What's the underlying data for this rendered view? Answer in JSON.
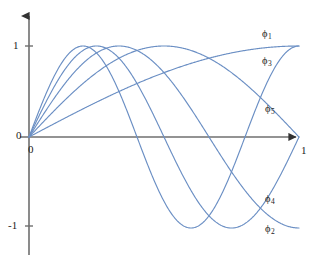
{
  "figure": {
    "width": 322,
    "height": 263,
    "background": "#ffffff",
    "curve_color": "#6b8fc4",
    "axis_color": "#555555",
    "text_color": "#1b1b1b"
  },
  "axes": {
    "x_axis_label": "1",
    "x_origin_label": "0",
    "y_origin_label": "0",
    "y_tick_top_label": "1",
    "y_tick_bottom_label": "-1",
    "x_arrow": "arrow-right",
    "y_arrow": "arrow-up"
  },
  "labels": {
    "phi1": "ϕ",
    "phi1_sub": "1",
    "phi2": "ϕ",
    "phi2_sub": "2",
    "phi3": "ϕ",
    "phi3_sub": "3",
    "phi4": "ϕ",
    "phi4_sub": "4",
    "phi5": "ϕ",
    "phi5_sub": "5"
  },
  "chart_data": {
    "type": "line",
    "title": "",
    "xlabel": "",
    "ylabel": "",
    "xlim": [
      0,
      1
    ],
    "ylim": [
      -1,
      1
    ],
    "xticks": [
      0,
      1
    ],
    "xticklabels": [
      "0",
      "1"
    ],
    "yticks": [
      -1,
      0,
      1
    ],
    "yticklabels": [
      "-1",
      "0",
      "1"
    ],
    "grid": false,
    "legend": "inline-curve-labels",
    "series": [
      {
        "name": "ϕ₁",
        "n": 1,
        "formula": "sin(pi*x/2)",
        "label_position": {
          "x": 0.82,
          "y": 0.93
        },
        "x": [
          0,
          0.05,
          0.1,
          0.15,
          0.2,
          0.25,
          0.3,
          0.35,
          0.4,
          0.45,
          0.5,
          0.55,
          0.6,
          0.65,
          0.7,
          0.75,
          0.8,
          0.85,
          0.9,
          0.95,
          1
        ],
        "values": [
          0,
          0.078,
          0.156,
          0.233,
          0.309,
          0.383,
          0.454,
          0.522,
          0.588,
          0.649,
          0.707,
          0.76,
          0.809,
          0.853,
          0.891,
          0.924,
          0.951,
          0.972,
          0.988,
          0.997,
          1
        ]
      },
      {
        "name": "ϕ₂",
        "n": 2,
        "formula": "sin(2*pi*x/2)",
        "label_position": {
          "x": 0.82,
          "y": -0.96
        },
        "x": [
          0,
          0.05,
          0.1,
          0.15,
          0.2,
          0.25,
          0.3,
          0.35,
          0.4,
          0.45,
          0.5,
          0.55,
          0.6,
          0.65,
          0.7,
          0.75,
          0.8,
          0.85,
          0.9,
          0.95,
          1
        ],
        "values": [
          0,
          0.156,
          0.309,
          0.454,
          0.588,
          0.707,
          0.809,
          0.891,
          0.951,
          0.988,
          1,
          0.988,
          0.951,
          0.891,
          0.809,
          0.707,
          0.588,
          0.454,
          0.309,
          0.156,
          0
        ]
      },
      {
        "name": "ϕ₃",
        "n": 3,
        "formula": "sin(3*pi*x/2)",
        "label_position": {
          "x": 0.82,
          "y": 0.7
        },
        "x": [
          0,
          0.05,
          0.1,
          0.15,
          0.2,
          0.25,
          0.3,
          0.35,
          0.4,
          0.45,
          0.5,
          0.55,
          0.6,
          0.65,
          0.7,
          0.75,
          0.8,
          0.85,
          0.9,
          0.95,
          1
        ],
        "values": [
          0,
          0.233,
          0.454,
          0.649,
          0.809,
          0.924,
          0.988,
          0.997,
          0.951,
          0.853,
          0.707,
          0.522,
          0.309,
          0.078,
          -0.156,
          -0.383,
          -0.588,
          -0.76,
          -0.891,
          -0.972,
          -1
        ]
      },
      {
        "name": "ϕ₄",
        "n": 4,
        "formula": "sin(4*pi*x/2)",
        "label_position": {
          "x": 0.82,
          "y": -0.62
        },
        "x": [
          0,
          0.05,
          0.1,
          0.15,
          0.2,
          0.25,
          0.3,
          0.35,
          0.4,
          0.45,
          0.5,
          0.55,
          0.6,
          0.65,
          0.7,
          0.75,
          0.8,
          0.85,
          0.9,
          0.95,
          1
        ],
        "values": [
          0,
          0.309,
          0.588,
          0.809,
          0.951,
          1,
          0.951,
          0.809,
          0.588,
          0.309,
          0,
          -0.309,
          -0.588,
          -0.809,
          -0.951,
          -1,
          -0.951,
          -0.809,
          -0.588,
          -0.309,
          0
        ]
      },
      {
        "name": "ϕ₅",
        "n": 5,
        "formula": "sin(5*pi*x/2)",
        "label_position": {
          "x": 0.83,
          "y": 0.18
        },
        "x": [
          0,
          0.05,
          0.1,
          0.15,
          0.2,
          0.25,
          0.3,
          0.35,
          0.4,
          0.45,
          0.5,
          0.55,
          0.6,
          0.65,
          0.7,
          0.75,
          0.8,
          0.85,
          0.9,
          0.95,
          1
        ],
        "values": [
          0,
          0.383,
          0.707,
          0.924,
          1,
          0.924,
          0.707,
          0.383,
          0,
          -0.383,
          -0.707,
          -0.924,
          -1,
          -0.924,
          -0.707,
          -0.383,
          0,
          0.383,
          0.707,
          0.924,
          1
        ]
      }
    ]
  }
}
